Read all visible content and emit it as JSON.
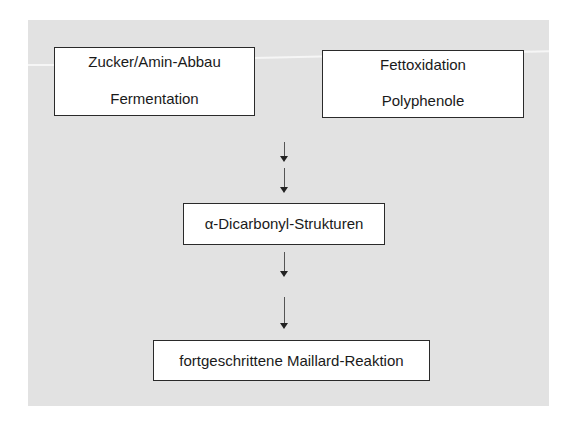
{
  "diagram": {
    "sources": [
      {
        "lines": [
          "Zucker/Amin-Abbau",
          "Fermentation"
        ]
      },
      {
        "lines": [
          "Fettoxidation",
          "Polyphenole"
        ]
      }
    ],
    "intermediate": "α-Dicarbonyl-Strukturen",
    "result": "fortgeschrittene Maillard-Reaktion",
    "colors": {
      "background": "#e2e2e2",
      "box_fill": "#ffffff",
      "box_border": "#2a2a2a",
      "arrow": "#222222"
    }
  }
}
